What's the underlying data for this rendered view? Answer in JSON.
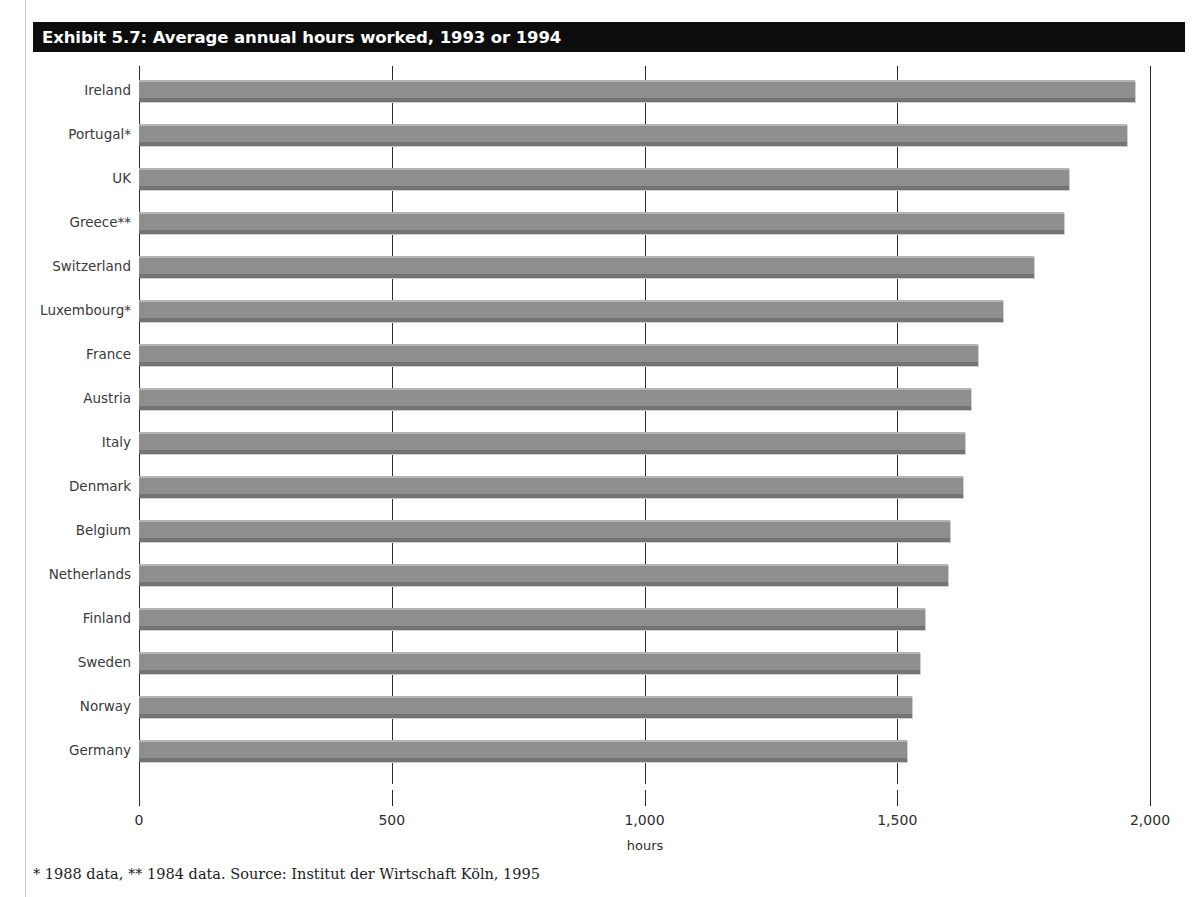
{
  "exhibit": {
    "title": "Exhibit 5.7: Average annual hours worked, 1993 or 1994",
    "footnote": "* 1988 data, ** 1984 data. Source: Institut der Wirtschaft Köln, 1995"
  },
  "colors": {
    "banner_background": "#0d0d0d",
    "banner_text": "#ffffff",
    "bar_fill": "#8e8e8e",
    "bar_highlight": "#b4b4b4",
    "bar_shadow": "#747474",
    "axis": "#2b2b2b",
    "label_text": "#3a3a3a"
  },
  "chart_data": {
    "type": "bar",
    "orientation": "horizontal",
    "title": "Exhibit 5.7: Average annual hours worked, 1993 or 1994",
    "xlabel": "hours",
    "ylabel": "",
    "xlim": [
      0,
      2000
    ],
    "grid": true,
    "legend": false,
    "categories": [
      "Ireland",
      "Portugal*",
      "UK",
      "Greece**",
      "Switzerland",
      "Luxembourg*",
      "France",
      "Austria",
      "Italy",
      "Denmark",
      "Belgium",
      "Netherlands",
      "Finland",
      "Sweden",
      "Norway",
      "Germany"
    ],
    "values": [
      1970,
      1955,
      1840,
      1830,
      1770,
      1710,
      1660,
      1645,
      1635,
      1630,
      1605,
      1600,
      1555,
      1545,
      1530,
      1520
    ],
    "xticks": [
      0,
      500,
      1000,
      1500,
      2000
    ],
    "xtick_labels": [
      "0",
      "500",
      "1,000",
      "1,500",
      "2,000"
    ]
  }
}
